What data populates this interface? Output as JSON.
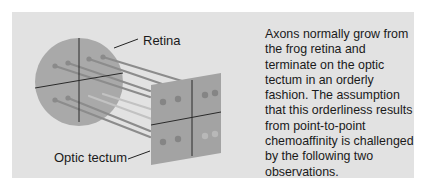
{
  "diagram": {
    "labels": {
      "retina": "Retina",
      "optic_tectum": "Optic tectum"
    },
    "caption_lines": [
      "Axons normally grow from",
      "the frog retina and",
      "terminate on the optic",
      "tectum in an orderly",
      "fashion. The assumption",
      "that this orderliness results",
      "from point-to-point",
      "chemoaffinity is challenged",
      "by the following two",
      "observations."
    ],
    "colors": {
      "background": "#e2e2e2",
      "retina_fill": "#a9a9a9",
      "tectum_fill": "#a3a3a3",
      "axon": "#8a8a8a",
      "dot": "#7d7d7d",
      "line": "#222222"
    }
  }
}
